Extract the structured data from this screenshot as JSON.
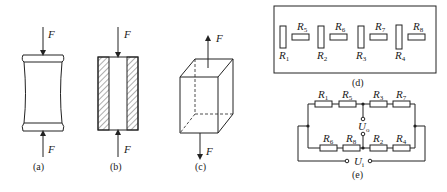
{
  "figures": {
    "a": {
      "caption": "(a)",
      "force_top": "F",
      "force_bottom": "F",
      "description": "compression specimen (barrel)"
    },
    "b": {
      "caption": "(b)",
      "force_top": "F",
      "force_bottom": "F",
      "description": "hollow cylinder section, hatched walls"
    },
    "c": {
      "caption": "(c)",
      "force_top": "F",
      "force_bottom": "F",
      "description": "cube under tension"
    },
    "d": {
      "caption": "(d)",
      "resistors": [
        {
          "name": "R",
          "sub": "1",
          "orientation": "vertical"
        },
        {
          "name": "R",
          "sub": "5",
          "orientation": "horizontal"
        },
        {
          "name": "R",
          "sub": "2",
          "orientation": "vertical"
        },
        {
          "name": "R",
          "sub": "6",
          "orientation": "horizontal"
        },
        {
          "name": "R",
          "sub": "3",
          "orientation": "vertical"
        },
        {
          "name": "R",
          "sub": "7",
          "orientation": "horizontal"
        },
        {
          "name": "R",
          "sub": "4",
          "orientation": "vertical"
        },
        {
          "name": "R",
          "sub": "8",
          "orientation": "horizontal"
        }
      ]
    },
    "e": {
      "caption": "(e)",
      "top_branch": [
        {
          "name": "R",
          "sub": "1"
        },
        {
          "name": "R",
          "sub": "5"
        },
        {
          "name": "R",
          "sub": "3"
        },
        {
          "name": "R",
          "sub": "7"
        }
      ],
      "bottom_branch": [
        {
          "name": "R",
          "sub": "6"
        },
        {
          "name": "R",
          "sub": "8"
        },
        {
          "name": "R",
          "sub": "2"
        },
        {
          "name": "R",
          "sub": "4"
        }
      ],
      "output_voltage": {
        "name": "U",
        "sub": "o"
      },
      "input_voltage": {
        "name": "U",
        "sub": "i"
      }
    }
  }
}
